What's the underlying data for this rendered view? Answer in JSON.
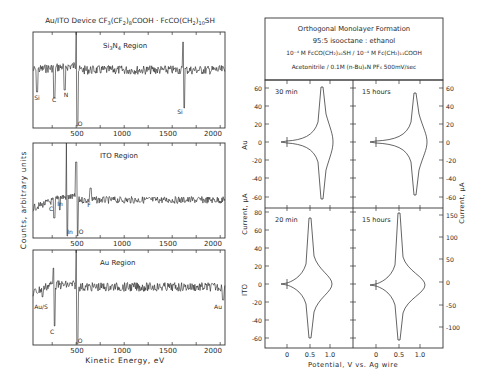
{
  "left_figure": {
    "title": "Au/ITO Device CF3(CF2)8COOH · FcCO(CH2)10SH",
    "title_parts": {
      "a": "Au/ITO Device CF",
      "s1": "3",
      "b": "(CF",
      "s2": "2",
      "c": ")",
      "s3": "8",
      "d": "COOH · FcCO(CH",
      "s4": "2",
      "e": ")",
      "s5": "10",
      "f": "SH"
    },
    "ylabel": "Counts, arbitrary units",
    "xlabel": "Kinetic Energy, eV",
    "x_ticks": [
      "500",
      "1000",
      "1500",
      "2000"
    ]
  },
  "right_figure": {
    "header": {
      "line1": "Orthogonal Monolayer Formation",
      "line2": "95:5 isooctane : ethanol",
      "line3": "10⁻⁴ M FcCO(CH₂)₁₀SH / 10⁻⁴ M Fc(CH₂)₁₁COOH",
      "line4": "Acetonitrile / 0.1M (n-Bu)₄N PF₆ 500mV/sec"
    },
    "ylabel_left": "Current, μA",
    "ylabel_right": "Current, μA",
    "xlabel": "Potential, V vs. Ag wire",
    "row_labels": [
      "Au",
      "ITO"
    ],
    "x_ticks": [
      "0",
      "0.5",
      "1.0"
    ]
  },
  "chart_data": [
    {
      "type": "line",
      "title": "Si3N4 Region",
      "xlabel": "Kinetic Energy, eV",
      "ylabel": "Counts, arbitrary units",
      "xlim": [
        50,
        2050
      ],
      "x_ticks": [
        500,
        1000,
        1500,
        2000
      ],
      "peak_annotations": [
        {
          "label": "Si",
          "x": 90
        },
        {
          "label": "C",
          "x": 272
        },
        {
          "label": "N",
          "x": 380
        },
        {
          "label": "O",
          "x": 510
        },
        {
          "label": "Si",
          "x": 1620
        }
      ]
    },
    {
      "type": "line",
      "title": "ITO Region",
      "xlabel": "Kinetic Energy, eV",
      "ylabel": "Counts, arbitrary units",
      "xlim": [
        50,
        2050
      ],
      "x_ticks": [
        500,
        1000,
        1500,
        2000
      ],
      "peak_annotations": [
        {
          "label": "C",
          "x": 272
        },
        {
          "label": "In",
          "x": 330
        },
        {
          "label": "In",
          "x": 404
        },
        {
          "label": "O",
          "x": 510
        },
        {
          "label": "F",
          "x": 655
        }
      ]
    },
    {
      "type": "line",
      "title": "Au Region",
      "xlabel": "Kinetic Energy, eV",
      "ylabel": "Counts, arbitrary units",
      "xlim": [
        50,
        2050
      ],
      "x_ticks": [
        500,
        1000,
        1500,
        2000
      ],
      "peak_annotations": [
        {
          "label": "Au/S",
          "x": 150
        },
        {
          "label": "C",
          "x": 272
        },
        {
          "label": "O",
          "x": 510
        },
        {
          "label": "Au",
          "x": 2020
        }
      ]
    },
    {
      "type": "line",
      "title": "30 min (Au)",
      "xlabel": "Potential, V vs. Ag wire",
      "ylabel": "Current, μA",
      "ylim": [
        -70,
        70
      ],
      "y_ticks": [
        -60,
        -40,
        -20,
        0,
        20,
        40,
        60
      ],
      "x_ticks": [
        0,
        0.5,
        1.0
      ],
      "anodic_peak": {
        "x": 0.62,
        "y": 63
      },
      "cathodic_peak": {
        "x": 0.62,
        "y": -65
      }
    },
    {
      "type": "line",
      "title": "15 hours (Au)",
      "xlabel": "Potential, V vs. Ag wire",
      "ylabel": "Current, μA",
      "ylim": [
        -70,
        70
      ],
      "y_ticks": [
        -60,
        -40,
        -20,
        0,
        20,
        40,
        60
      ],
      "x_ticks": [
        0,
        0.5,
        1.0
      ],
      "anodic_peak": {
        "x": 0.62,
        "y": 57
      },
      "cathodic_peak": {
        "x": 0.62,
        "y": -57
      }
    },
    {
      "type": "line",
      "title": "20 min (ITO)",
      "xlabel": "Potential, V vs. Ag wire",
      "ylabel": "Current, μA",
      "ylim": [
        -70,
        90
      ],
      "y_ticks": [
        -60,
        -40,
        -20,
        0,
        20,
        40,
        60,
        80
      ],
      "x_ticks": [
        0,
        0.5,
        1.0
      ],
      "anodic_peak": {
        "x": 0.52,
        "y": 78
      },
      "cathodic_peak": {
        "x": 0.52,
        "y": -62
      }
    },
    {
      "type": "line",
      "title": "15 hours (ITO)",
      "xlabel": "Potential, V vs. Ag wire",
      "ylabel": "Current, μA",
      "ylim": [
        -140,
        170
      ],
      "y_ticks": [
        -100,
        -50,
        0,
        50,
        100,
        150
      ],
      "x_ticks": [
        0,
        0.5,
        1.0
      ],
      "anodic_peak": {
        "x": 0.52,
        "y": 160
      },
      "cathodic_peak": {
        "x": 0.52,
        "y": -120
      }
    }
  ],
  "panels": {
    "si": {
      "label_a": "Si",
      "label_sub": "3",
      "label_b": "N",
      "label_sub2": "4",
      "label_c": " Region"
    },
    "ito": {
      "label": "ITO Region"
    },
    "au": {
      "label": "Au Region"
    },
    "cv": {
      "tl": "30 min",
      "tr": "15 hours",
      "bl": "20 min",
      "br": "15 hours"
    }
  },
  "annotations": {
    "si": [
      "Si",
      "C",
      "N",
      "O",
      "Si"
    ],
    "ito": [
      "C",
      "In",
      "In",
      "O",
      "F"
    ],
    "au": [
      "Au/S",
      "C",
      "O",
      "Au"
    ]
  },
  "axis": {
    "cv_left_top": [
      "60",
      "40",
      "20",
      "0",
      "-20",
      "-40",
      "-60"
    ],
    "cv_right_top": [
      "60",
      "40",
      "20",
      "0",
      "-20",
      "-40",
      "-60"
    ],
    "cv_left_bottom": [
      "80",
      "60",
      "40",
      "20",
      "0",
      "-20",
      "-40",
      "-60"
    ],
    "cv_right_bottom": [
      "150",
      "100",
      "50",
      "0",
      "-50",
      "-100"
    ]
  }
}
